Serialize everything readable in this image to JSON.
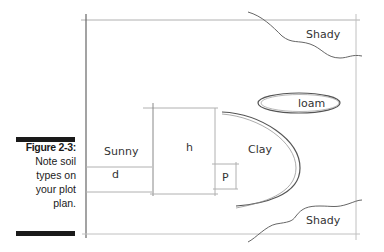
{
  "caption": {
    "figure": "Figure 2-3:",
    "lines": [
      "Note soil",
      "types on",
      "your plot",
      "plan."
    ]
  },
  "plan": {
    "labels": {
      "shady_top": "Shady",
      "shady_bottom": "Shady",
      "loam": "loam",
      "sunny": "Sunny",
      "h": "h",
      "clay": "Clay",
      "d": "d",
      "p": "P"
    },
    "colors": {
      "line": "#9a9a9a",
      "stroke": "#555555",
      "text": "#333333"
    }
  }
}
